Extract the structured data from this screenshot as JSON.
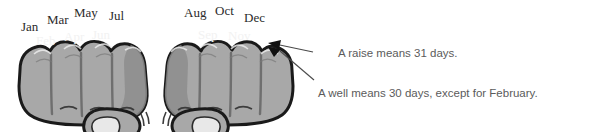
{
  "figure": {
    "background_color": "#ffffff",
    "skin_color": "#a8a8a8",
    "skin_shadow_color": "#8d8d8d",
    "outline_color": "#1a1a1a",
    "nail_color": "#e8e8e8",
    "top_label_color": "#2b2b2b",
    "knuckle_label_color": "#f2f2f2",
    "note_color": "#5b5b5b",
    "leader_line_color": "#4a4a4a"
  },
  "left_hand": {
    "name": "left-fist",
    "knuckle_labels": [
      {
        "text": "Jan",
        "x": 21,
        "y": 19
      },
      {
        "text": "Mar",
        "x": 47,
        "y": 12
      },
      {
        "text": "May",
        "x": 74,
        "y": 5
      },
      {
        "text": "Jul",
        "x": 109,
        "y": 8
      }
    ],
    "valley_labels": [
      {
        "text": "Feb",
        "x": 36,
        "y": 33
      },
      {
        "text": "Apr",
        "x": 64,
        "y": 29
      },
      {
        "text": "Jun",
        "x": 92,
        "y": 27
      }
    ]
  },
  "right_hand": {
    "name": "right-fist",
    "knuckle_labels": [
      {
        "text": "Aug",
        "x": 184,
        "y": 5
      },
      {
        "text": "Oct",
        "x": 215,
        "y": 3
      },
      {
        "text": "Dec",
        "x": 244,
        "y": 10
      }
    ],
    "valley_labels": [
      {
        "text": "Sep",
        "x": 198,
        "y": 27
      },
      {
        "text": "Nov",
        "x": 228,
        "y": 28
      }
    ]
  },
  "annotations": [
    {
      "id": "raise-note",
      "text": "A raise means 31 days.",
      "x": 338,
      "y": 47,
      "leader": {
        "x1": 313,
        "y1": 52,
        "x2": 272,
        "y2": 44
      },
      "points_to": "knuckle-raise"
    },
    {
      "id": "well-note",
      "text": "A well means 30 days, except for February.",
      "x": 318,
      "y": 87,
      "leader": {
        "x1": 314,
        "y1": 80,
        "x2": 277,
        "y2": 50
      },
      "points_to": "knuckle-well"
    }
  ]
}
